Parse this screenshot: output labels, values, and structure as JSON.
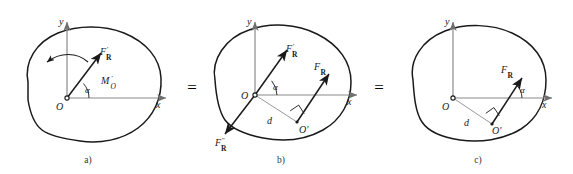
{
  "figure": {
    "background_color": "#ffffff",
    "stroke_color": "#1a1a1a",
    "axis_color": "#8a8a8a",
    "thin_line_color": "#9a9a9a",
    "width": 573,
    "height": 174
  },
  "relations": {
    "equals_1": "=",
    "equals_2": "="
  },
  "panels": [
    {
      "id": "a",
      "caption": "a)",
      "axis_x_label": "x",
      "axis_y_label": "y",
      "origin_label": "O",
      "angle_label": "α",
      "force_label_main": "F",
      "force_label_sub": "R",
      "force_label_prime": "′",
      "moment_label_main": "M",
      "moment_label_sub": "O",
      "moment_label_prime": "′",
      "description": "Body with resultant force F'R at O and couple moment M'O"
    },
    {
      "id": "b",
      "caption": "b)",
      "axis_x_label": "x",
      "axis_y_label": "y",
      "origin_label": "O",
      "point_label": "O′",
      "angle_label": "α",
      "distance_label": "d",
      "force_label_main": "F",
      "force_label_sub": "R",
      "force_prime_single": "′",
      "force_prime_double": "″",
      "description": "Equivalent system: F'R at O, F\"R opposite at O, and FR at O' separated by distance d"
    },
    {
      "id": "c",
      "caption": "c)",
      "axis_x_label": "x",
      "axis_y_label": "y",
      "origin_label": "O",
      "point_label": "O′",
      "angle_label": "α",
      "distance_label": "d",
      "force_label_main": "F",
      "force_label_sub": "R",
      "description": "Single resultant force FR acting at point O' a distance d from O"
    }
  ]
}
